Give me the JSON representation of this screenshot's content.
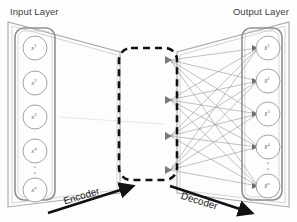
{
  "figure": {
    "type": "autoencoder-architecture-diagram",
    "background_color": "#fdfdfd",
    "frame_color": "#9a9a9a",
    "node_stroke_color": "#8c8c8c",
    "edge_color": "#8f8f8f",
    "dashed_box_color": "#111111",
    "arrow_color": "#111111",
    "text_color": "#3d3d3d"
  },
  "titles": {
    "input": "Input Layer",
    "output": "Output Layer"
  },
  "input_layer": {
    "name": "Input Layer",
    "node_count_visible": 5,
    "has_vertical_ellipsis": true,
    "ellipsis_after_index": 3,
    "nodes": [
      {
        "base": "x",
        "sup": "1",
        "label": "x1"
      },
      {
        "base": "x",
        "sup": "2",
        "label": "x2"
      },
      {
        "base": "x",
        "sup": "3",
        "label": "x3"
      },
      {
        "base": "x",
        "sup": "4",
        "label": "x4"
      },
      {
        "base": "x",
        "sup": "n",
        "label": "xn"
      }
    ]
  },
  "latent_layer": {
    "name": "Latent / Bottleneck",
    "enclosed_by_dashed_box": true,
    "node_count": 4,
    "node_style": "small-filled-triangle-marker"
  },
  "output_layer": {
    "name": "Output Layer",
    "node_count_visible": 5,
    "has_vertical_ellipsis": true,
    "ellipsis_after_index": 3,
    "nodes": [
      {
        "base": "x̂",
        "sup": "1",
        "label": "x̂1"
      },
      {
        "base": "x̂",
        "sup": "2",
        "label": "x̂2"
      },
      {
        "base": "x̂",
        "sup": "3",
        "label": "x̂3"
      },
      {
        "base": "x̂",
        "sup": "4",
        "label": "x̂4"
      },
      {
        "base": "x̂",
        "sup": "n",
        "label": "x̂n"
      }
    ]
  },
  "annotations": {
    "encoder": {
      "label": "Encoder",
      "arrow_direction": "up-right"
    },
    "decoder": {
      "label": "Decoder",
      "arrow_direction": "down-right"
    }
  },
  "ellipsis_glyph": "·"
}
